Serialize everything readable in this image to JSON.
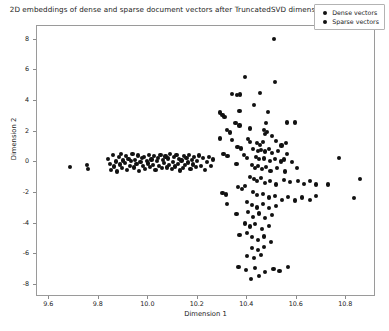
{
  "chart_data": {
    "type": "scatter",
    "title": "2D embeddings of dense and sparse document vectors after TruncatedSVD dimensionality reduction",
    "xlabel": "Dimension 1",
    "ylabel": "Dimension 2",
    "xlim": [
      9.55,
      10.92
    ],
    "ylim": [
      -8.8,
      8.9
    ],
    "grid": false,
    "legend_position": "upper right",
    "marker": "circle",
    "series": [
      {
        "name": "Dense vectors",
        "color": "#111111",
        "points": [
          [
            9.683,
            -0.3
          ],
          [
            9.752,
            -0.18
          ],
          [
            9.757,
            -0.42
          ],
          [
            9.838,
            0.2
          ],
          [
            9.845,
            -0.1
          ],
          [
            9.85,
            -0.52
          ],
          [
            9.858,
            0.46
          ],
          [
            9.862,
            -0.28
          ],
          [
            9.869,
            0.05
          ],
          [
            9.874,
            -0.6
          ],
          [
            9.88,
            0.33
          ],
          [
            9.884,
            -0.14
          ],
          [
            9.89,
            0.52
          ],
          [
            9.895,
            -0.38
          ],
          [
            9.899,
            0.12
          ],
          [
            9.905,
            -0.05
          ],
          [
            9.91,
            0.4
          ],
          [
            9.915,
            -0.48
          ],
          [
            9.92,
            0.22
          ],
          [
            9.925,
            -0.22
          ],
          [
            9.93,
            0.08
          ],
          [
            9.936,
            0.55
          ],
          [
            9.941,
            -0.34
          ],
          [
            9.947,
            0.15
          ],
          [
            9.952,
            -0.12
          ],
          [
            9.957,
            0.44
          ],
          [
            9.962,
            -0.56
          ],
          [
            9.968,
            0.02
          ],
          [
            9.973,
            0.28
          ],
          [
            9.978,
            -0.26
          ],
          [
            9.983,
            0.36
          ],
          [
            9.988,
            -0.44
          ],
          [
            9.993,
            0.1
          ],
          [
            9.998,
            -0.08
          ],
          [
            10.003,
            0.5
          ],
          [
            10.008,
            -0.3
          ],
          [
            10.013,
            0.18
          ],
          [
            10.018,
            -0.16
          ],
          [
            10.024,
            0.42
          ],
          [
            10.029,
            -0.52
          ],
          [
            10.034,
            0.06
          ],
          [
            10.039,
            0.3
          ],
          [
            10.044,
            -0.24
          ],
          [
            10.049,
            0.48
          ],
          [
            10.054,
            -0.4
          ],
          [
            10.059,
            0.14
          ],
          [
            10.064,
            -0.06
          ],
          [
            10.069,
            0.38
          ],
          [
            10.074,
            -0.34
          ],
          [
            10.079,
            0.24
          ],
          [
            10.084,
            -0.18
          ],
          [
            10.089,
            0.54
          ],
          [
            10.094,
            -0.46
          ],
          [
            10.099,
            0.04
          ],
          [
            10.104,
            0.32
          ],
          [
            10.109,
            -0.28
          ],
          [
            10.114,
            0.46
          ],
          [
            10.119,
            -0.1
          ],
          [
            10.124,
            0.2
          ],
          [
            10.129,
            -0.54
          ],
          [
            10.134,
            0.12
          ],
          [
            10.139,
            -0.36
          ],
          [
            10.144,
            0.4
          ],
          [
            10.149,
            -0.2
          ],
          [
            10.154,
            0.26
          ],
          [
            10.16,
            -0.02
          ],
          [
            10.165,
            0.5
          ],
          [
            10.17,
            -0.44
          ],
          [
            10.175,
            0.16
          ],
          [
            10.18,
            -0.14
          ],
          [
            10.186,
            0.34
          ],
          [
            10.192,
            -0.32
          ],
          [
            10.198,
            0.08
          ],
          [
            10.205,
            0.44
          ],
          [
            10.212,
            -0.22
          ],
          [
            10.22,
            0.28
          ],
          [
            10.228,
            -0.48
          ],
          [
            10.236,
            0.0
          ],
          [
            10.244,
            0.36
          ],
          [
            10.252,
            -0.26
          ],
          [
            10.26,
            0.18
          ]
        ]
      },
      {
        "name": "Sparse vectors",
        "color": "#111111",
        "points": [
          [
            10.508,
            8.05
          ],
          [
            10.392,
            5.55
          ],
          [
            10.512,
            5.25
          ],
          [
            10.337,
            4.45
          ],
          [
            10.357,
            4.4
          ],
          [
            10.372,
            4.42
          ],
          [
            10.452,
            4.55
          ],
          [
            10.29,
            3.25
          ],
          [
            10.3,
            3.1
          ],
          [
            10.308,
            2.95
          ],
          [
            10.368,
            3.35
          ],
          [
            10.428,
            3.75
          ],
          [
            10.482,
            3.3
          ],
          [
            10.352,
            2.55
          ],
          [
            10.368,
            2.4
          ],
          [
            10.412,
            2.2
          ],
          [
            10.476,
            2.55
          ],
          [
            10.56,
            2.6
          ],
          [
            10.592,
            2.6
          ],
          [
            10.318,
            2.1
          ],
          [
            10.33,
            1.95
          ],
          [
            10.468,
            2.1
          ],
          [
            10.472,
            1.85
          ],
          [
            10.48,
            2.0
          ],
          [
            10.5,
            1.7
          ],
          [
            10.288,
            1.55
          ],
          [
            10.338,
            1.45
          ],
          [
            10.404,
            1.5
          ],
          [
            10.412,
            1.35
          ],
          [
            10.44,
            1.25
          ],
          [
            10.452,
            1.15
          ],
          [
            10.462,
            1.3
          ],
          [
            10.516,
            1.4
          ],
          [
            10.538,
            1.1
          ],
          [
            10.556,
            1.25
          ],
          [
            10.36,
            1.0
          ],
          [
            10.376,
            0.9
          ],
          [
            10.424,
            0.85
          ],
          [
            10.444,
            0.75
          ],
          [
            10.456,
            0.8
          ],
          [
            10.472,
            0.7
          ],
          [
            10.486,
            0.88
          ],
          [
            10.5,
            0.6
          ],
          [
            10.524,
            0.72
          ],
          [
            10.56,
            0.55
          ],
          [
            10.304,
            0.55
          ],
          [
            10.32,
            0.4
          ],
          [
            10.388,
            0.45
          ],
          [
            10.4,
            0.3
          ],
          [
            10.436,
            0.35
          ],
          [
            10.448,
            0.2
          ],
          [
            10.466,
            0.25
          ],
          [
            10.49,
            0.1
          ],
          [
            10.512,
            0.22
          ],
          [
            10.536,
            0.05
          ],
          [
            10.548,
            0.18
          ],
          [
            10.58,
            0.0
          ],
          [
            10.77,
            0.3
          ],
          [
            10.356,
            -0.1
          ],
          [
            10.42,
            -0.2
          ],
          [
            10.432,
            -0.35
          ],
          [
            10.444,
            -0.25
          ],
          [
            10.46,
            -0.45
          ],
          [
            10.476,
            -0.3
          ],
          [
            10.494,
            -0.55
          ],
          [
            10.52,
            -0.4
          ],
          [
            10.552,
            -0.6
          ],
          [
            10.6,
            -0.35
          ],
          [
            10.412,
            -0.95
          ],
          [
            10.428,
            -1.1
          ],
          [
            10.44,
            -1.25
          ],
          [
            10.456,
            -1.05
          ],
          [
            10.47,
            -1.35
          ],
          [
            10.49,
            -1.2
          ],
          [
            10.516,
            -1.45
          ],
          [
            10.548,
            -1.15
          ],
          [
            10.572,
            -1.3
          ],
          [
            10.604,
            -1.2
          ],
          [
            10.63,
            -1.4
          ],
          [
            10.652,
            -1.25
          ],
          [
            10.676,
            -1.45
          ],
          [
            10.362,
            -1.6
          ],
          [
            10.378,
            -1.75
          ],
          [
            10.392,
            -1.55
          ],
          [
            10.726,
            -1.45
          ],
          [
            10.856,
            -1.1
          ],
          [
            10.3,
            -2.0
          ],
          [
            10.314,
            -2.1
          ],
          [
            10.424,
            -1.95
          ],
          [
            10.438,
            -2.15
          ],
          [
            10.464,
            -2.05
          ],
          [
            10.486,
            -2.3
          ],
          [
            10.512,
            -2.2
          ],
          [
            10.54,
            -2.45
          ],
          [
            10.566,
            -2.25
          ],
          [
            10.592,
            -2.5
          ],
          [
            10.62,
            -2.3
          ],
          [
            10.652,
            -2.45
          ],
          [
            10.676,
            -2.2
          ],
          [
            10.83,
            -2.35
          ],
          [
            10.318,
            -2.75
          ],
          [
            10.4,
            -2.6
          ],
          [
            10.418,
            -2.8
          ],
          [
            10.44,
            -2.95
          ],
          [
            10.464,
            -2.7
          ],
          [
            10.488,
            -3.0
          ],
          [
            10.516,
            -2.85
          ],
          [
            10.356,
            -3.4
          ],
          [
            10.404,
            -3.25
          ],
          [
            10.424,
            -3.55
          ],
          [
            10.448,
            -3.35
          ],
          [
            10.472,
            -3.65
          ],
          [
            10.5,
            -3.45
          ],
          [
            10.392,
            -4.0
          ],
          [
            10.412,
            -4.2
          ],
          [
            10.432,
            -4.05
          ],
          [
            10.458,
            -4.35
          ],
          [
            10.486,
            -4.15
          ],
          [
            10.368,
            -4.75
          ],
          [
            10.4,
            -4.6
          ],
          [
            10.42,
            -4.9
          ],
          [
            10.444,
            -5.1
          ],
          [
            10.468,
            -4.85
          ],
          [
            10.496,
            -5.2
          ],
          [
            10.418,
            -5.6
          ],
          [
            10.444,
            -5.75
          ],
          [
            10.466,
            -5.55
          ],
          [
            10.4,
            -6.1
          ],
          [
            10.428,
            -6.25
          ],
          [
            10.456,
            -6.05
          ],
          [
            10.364,
            -6.85
          ],
          [
            10.396,
            -7.05
          ],
          [
            10.432,
            -6.9
          ],
          [
            10.47,
            -7.15
          ],
          [
            10.506,
            -6.95
          ],
          [
            10.53,
            -7.1
          ],
          [
            10.566,
            -6.85
          ],
          [
            10.416,
            -7.6
          ],
          [
            10.448,
            -7.45
          ]
        ]
      }
    ],
    "xticks": [
      {
        "value": 9.6,
        "label": "9.6"
      },
      {
        "value": 9.8,
        "label": "9.8"
      },
      {
        "value": 10.0,
        "label": "10.0"
      },
      {
        "value": 10.2,
        "label": "10.2"
      },
      {
        "value": 10.4,
        "label": "10.4"
      },
      {
        "value": 10.6,
        "label": "10.6"
      },
      {
        "value": 10.8,
        "label": "10.8"
      }
    ],
    "yticks": [
      {
        "value": 8,
        "label": "8"
      },
      {
        "value": 6,
        "label": "6"
      },
      {
        "value": 4,
        "label": "4"
      },
      {
        "value": 2,
        "label": "2"
      },
      {
        "value": 0,
        "label": "0"
      },
      {
        "value": -2,
        "label": "-2"
      },
      {
        "value": -4,
        "label": "-4"
      },
      {
        "value": -6,
        "label": "-6"
      },
      {
        "value": -8,
        "label": "-8"
      }
    ]
  },
  "legend": {
    "entries": [
      {
        "label": "Dense vectors"
      },
      {
        "label": "Sparse vectors"
      }
    ]
  }
}
